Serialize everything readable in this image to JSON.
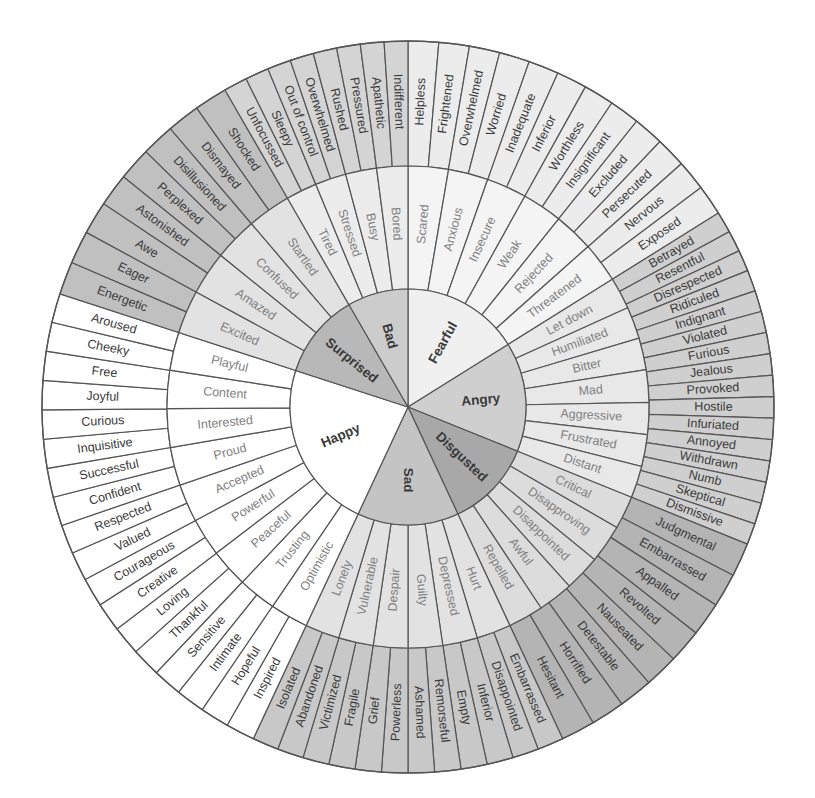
{
  "diagram": {
    "type": "sunburst",
    "center": [
      408,
      407
    ],
    "radii": {
      "core": 118,
      "middle": 241,
      "outer": 366
    }
  },
  "colors": {
    "line": "#555555",
    "white": "#ffffff",
    "light_gray": "#ececec",
    "mid_gray": "#d6d6d6",
    "dark_gray": "#bdbdbd",
    "darker_gray": "#a9a9a9",
    "text_dark": "#3a3a3a",
    "text_mid": "#808080"
  },
  "core": [
    {
      "label": "Fearful",
      "start": 0,
      "end": 58,
      "fill": "#f0f0f0",
      "middle_fill": "#f4f4f4",
      "outer_fill": "#ececec"
    },
    {
      "label": "Angry",
      "start": 58,
      "end": 112,
      "fill": "#cfcfcf",
      "middle_fill": "#e8e8e8",
      "outer_fill": "#cfcfcf"
    },
    {
      "label": "Disgusted",
      "start": 112,
      "end": 155,
      "fill": "#a8a8a8",
      "middle_fill": "#dcdcdc",
      "outer_fill": "#b4b4b4"
    },
    {
      "label": "Sad",
      "start": 155,
      "end": 205,
      "fill": "#c4c4c4",
      "middle_fill": "#e2e2e2",
      "outer_fill": "#c8c8c8"
    },
    {
      "label": "Happy",
      "start": 205,
      "end": 288,
      "fill": "#ffffff",
      "middle_fill": "#ffffff",
      "outer_fill": "#ffffff"
    },
    {
      "label": "Surprised",
      "start": 288,
      "end": 330,
      "fill": "#b8b8b8",
      "middle_fill": "#e2e2e2",
      "outer_fill": "#c0c0c0"
    },
    {
      "label": "Bad",
      "start": 330,
      "end": 360,
      "fill": "#cccccc",
      "middle_fill": "#ececec",
      "outer_fill": "#d4d4d4"
    }
  ],
  "middle": [
    {
      "label": "Scared",
      "core": "Fearful",
      "start": 0,
      "end": 9.7
    },
    {
      "label": "Anxious",
      "core": "Fearful",
      "start": 9.7,
      "end": 19.3
    },
    {
      "label": "Insecure",
      "core": "Fearful",
      "start": 19.3,
      "end": 29
    },
    {
      "label": "Weak",
      "core": "Fearful",
      "start": 29,
      "end": 38.7
    },
    {
      "label": "Rejected",
      "core": "Fearful",
      "start": 38.7,
      "end": 48.3
    },
    {
      "label": "Threatened",
      "core": "Fearful",
      "start": 48.3,
      "end": 58
    },
    {
      "label": "Let down",
      "core": "Angry",
      "start": 58,
      "end": 65.7
    },
    {
      "label": "Humiliated",
      "core": "Angry",
      "start": 65.7,
      "end": 73.4
    },
    {
      "label": "Bitter",
      "core": "Angry",
      "start": 73.4,
      "end": 81.1
    },
    {
      "label": "Mad",
      "core": "Angry",
      "start": 81.1,
      "end": 88.9
    },
    {
      "label": "Aggressive",
      "core": "Angry",
      "start": 88.9,
      "end": 96.6
    },
    {
      "label": "Frustrated",
      "core": "Angry",
      "start": 96.6,
      "end": 104.3
    },
    {
      "label": "Distant",
      "core": "Angry",
      "start": 104.3,
      "end": 112
    },
    {
      "label": "Critical",
      "core": "Angry",
      "start": 112,
      "end": 120
    },
    {
      "label": "Disapproving",
      "core": "Disgusted",
      "start": 120,
      "end": 129.3
    },
    {
      "label": "Disappointed",
      "core": "Disgusted",
      "start": 129.3,
      "end": 138
    },
    {
      "label": "Awful",
      "core": "Disgusted",
      "start": 138,
      "end": 146.5
    },
    {
      "label": "Repelled",
      "core": "Disgusted",
      "start": 146.5,
      "end": 155
    },
    {
      "label": "Hurt",
      "core": "Sad",
      "start": 155,
      "end": 163.3
    },
    {
      "label": "Depressed",
      "core": "Sad",
      "start": 163.3,
      "end": 171.7
    },
    {
      "label": "Guilty",
      "core": "Sad",
      "start": 171.7,
      "end": 180
    },
    {
      "label": "Despair",
      "core": "Sad",
      "start": 180,
      "end": 188.3
    },
    {
      "label": "Vulnerable",
      "core": "Sad",
      "start": 188.3,
      "end": 196.7
    },
    {
      "label": "Lonely",
      "core": "Sad",
      "start": 196.7,
      "end": 205
    },
    {
      "label": "Optimistic",
      "core": "Happy",
      "start": 205,
      "end": 214.2
    },
    {
      "label": "Trusting",
      "core": "Happy",
      "start": 214.2,
      "end": 223.4
    },
    {
      "label": "Peaceful",
      "core": "Happy",
      "start": 223.4,
      "end": 232.7
    },
    {
      "label": "Powerful",
      "core": "Happy",
      "start": 232.7,
      "end": 241.9
    },
    {
      "label": "Accepted",
      "core": "Happy",
      "start": 241.9,
      "end": 251.1
    },
    {
      "label": "Proud",
      "core": "Happy",
      "start": 251.1,
      "end": 260.3
    },
    {
      "label": "Interested",
      "core": "Happy",
      "start": 260.3,
      "end": 269.6
    },
    {
      "label": "Content",
      "core": "Happy",
      "start": 269.6,
      "end": 278.8
    },
    {
      "label": "Playful",
      "core": "Happy",
      "start": 278.8,
      "end": 288
    },
    {
      "label": "Excited",
      "core": "Surprised",
      "start": 288,
      "end": 298.5
    },
    {
      "label": "Amazed",
      "core": "Surprised",
      "start": 298.5,
      "end": 309
    },
    {
      "label": "Confused",
      "core": "Surprised",
      "start": 309,
      "end": 319.5
    },
    {
      "label": "Startled",
      "core": "Surprised",
      "start": 319.5,
      "end": 330
    },
    {
      "label": "Tired",
      "core": "Bad",
      "start": 330,
      "end": 337.5
    },
    {
      "label": "Stressed",
      "core": "Bad",
      "start": 337.5,
      "end": 345
    },
    {
      "label": "Busy",
      "core": "Bad",
      "start": 345,
      "end": 352.5
    },
    {
      "label": "Bored",
      "core": "Bad",
      "start": 352.5,
      "end": 360
    }
  ],
  "middle_fills": {
    "Critical": "#dcdcdc"
  },
  "outer": [
    "Helpless",
    "Frightened",
    "Overwhelmed",
    "Worried",
    "Inadequate",
    "Inferior",
    "Worthless",
    "Insignificant",
    "Excluded",
    "Persecuted",
    "Nervous",
    "Exposed",
    "Betrayed",
    "Resentful",
    "Disrespected",
    "Ridiculed",
    "Indignant",
    "Violated",
    "Furious",
    "Jealous",
    "Provoked",
    "Hostile",
    "Infuriated",
    "Annoyed",
    "Withdrawn",
    "Numb",
    "Skeptical",
    "Dismissive",
    "Judgmental",
    "Embarrassed",
    "Appalled",
    "Revolted",
    "Nauseated",
    "Detestable",
    "Horrified",
    "Hesitant",
    "Embarrassed",
    "Disappointed",
    "Inferior",
    "Empty",
    "Remorseful",
    "Ashamed",
    "Powerless",
    "Grief",
    "Fragile",
    "Victimized",
    "Abandoned",
    "Isolated",
    "Inspired",
    "Hopeful",
    "Intimate",
    "Sensitive",
    "Thankful",
    "Loving",
    "Creative",
    "Courageous",
    "Valued",
    "Respected",
    "Confident",
    "Successful",
    "Inquisitive",
    "Curious",
    "Joyful",
    "Free",
    "Cheeky",
    "Aroused",
    "Energetic",
    "Eager",
    "Awe",
    "Astonished",
    "Perplexed",
    "Disillusioned",
    "Dismayed",
    "Shocked",
    "Unfocussed",
    "Sleepy",
    "Out of control",
    "Overwhelmed",
    "Rushed",
    "Pressured",
    "Apathetic",
    "Indifferent"
  ],
  "outer_groups": [
    {
      "core": "Fearful",
      "count": 12
    },
    {
      "core": "Angry",
      "count": 16
    },
    {
      "core": "Disgusted",
      "count": 8
    },
    {
      "core": "Sad",
      "count": 12
    },
    {
      "core": "Happy",
      "count": 18
    },
    {
      "core": "Surprised",
      "count": 8
    },
    {
      "core": "Bad",
      "count": 8
    }
  ]
}
